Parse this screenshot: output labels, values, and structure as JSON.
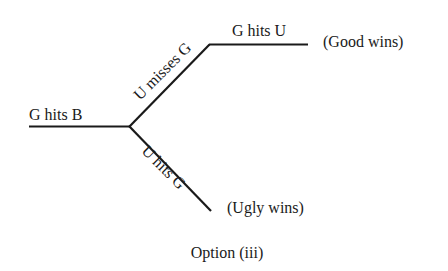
{
  "diagram": {
    "type": "game-tree",
    "caption": "Option (iii)",
    "root_edge": {
      "label": "G hits B"
    },
    "branches": [
      {
        "edge_label": "U misses G",
        "next_edge_label": "G hits U",
        "outcome": "(Good wins)"
      },
      {
        "edge_label": "U hits G",
        "outcome": "(Ugly wins)"
      }
    ],
    "colors": {
      "ink": "#1a1a1a",
      "background": "#ffffff"
    }
  }
}
